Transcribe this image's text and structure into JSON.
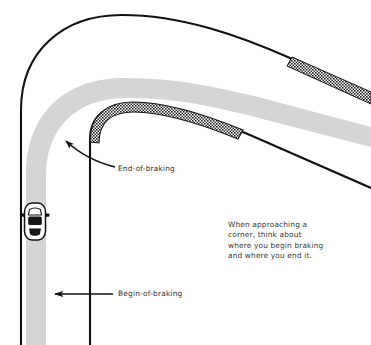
{
  "diagram": {
    "caption": {
      "text": "When approaching a\ncorner, think about\nwhere you begin braking\nand where you end it."
    },
    "annotations": [
      {
        "id": "end-of-braking",
        "label": "End-of-braking"
      },
      {
        "id": "begin-of-braking",
        "label": "Begin-of-braking"
      }
    ],
    "elements": {
      "car_icon": "car-top-view-icon",
      "racing_line": "racing-line-band",
      "outer_track_edge": "outer-track-edge-line",
      "inner_track_edge": "inner-track-edge-line",
      "apex_curb": "apex-curb-hatched",
      "exit_curb": "exit-curb-hatched",
      "end_of_braking_arrow": "curved-arrow-up-left",
      "begin_of_braking_arrow": "straight-arrow-left"
    },
    "colors": {
      "background": "#ffffff",
      "racing_line": "#d5d5d5",
      "track_edge": "#000000",
      "curb_dark": "#2b2b2b",
      "text": "#2e2e2e",
      "caption_text": "#3a3a3a"
    }
  }
}
